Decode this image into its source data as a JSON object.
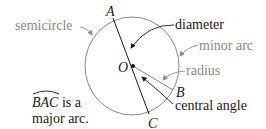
{
  "diagram": {
    "points": {
      "A": "A",
      "B": "B",
      "C": "C",
      "O": "O"
    },
    "labels": {
      "semicircle": "semicircle",
      "diameter": "diameter",
      "minor_arc": "minor arc",
      "radius": "radius",
      "central_angle": "central angle",
      "major_arc_name": "BAC",
      "major_arc_line1_suffix": " is a",
      "major_arc_line2": "major arc."
    },
    "colors": {
      "primary_text": "#1a1a1a",
      "secondary_text": "#8a8a8a",
      "circle_stroke": "#8a8a8a",
      "line_stroke": "#1a1a1a",
      "radius_stroke": "#8a8a8a",
      "background": "#ffffff"
    }
  }
}
